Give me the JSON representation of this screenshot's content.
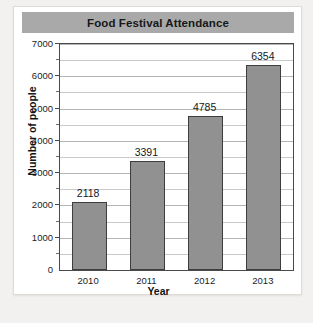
{
  "chart_data": {
    "type": "bar",
    "title": "Food Festival Attendance",
    "xlabel": "Year",
    "ylabel": "Number of people",
    "categories": [
      "2010",
      "2011",
      "2012",
      "2013"
    ],
    "values": [
      2118,
      3391,
      4785,
      6354
    ],
    "value_labels": [
      "2118",
      "3391",
      "4785",
      "6354"
    ],
    "ylim": [
      0,
      7000
    ],
    "y_ticks": [
      0,
      1000,
      2000,
      3000,
      4000,
      5000,
      6000,
      7000
    ],
    "y_tick_labels": [
      "0",
      "1000",
      "2000",
      "3000",
      "4000",
      "5000",
      "6000",
      "7000"
    ],
    "y_minor_step": 500,
    "grid": true,
    "legend": false,
    "bar_color": "#919191",
    "bar_edge_color": "#3d3d3d",
    "title_banner_color": "#a9a9a9",
    "plot_border_color": "#4a4a4a",
    "gridline_color": "#c9c9c9",
    "card_background": "#ffffff",
    "page_background": "#f2f1ef"
  }
}
